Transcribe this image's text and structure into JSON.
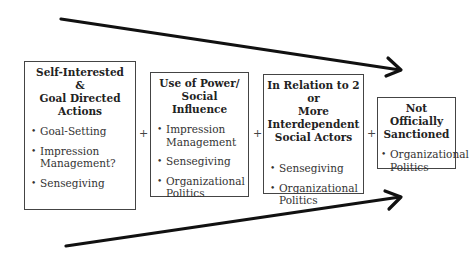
{
  "diagram": {
    "boxes": [
      {
        "title": "Self-Interested & Goal Directed Actions",
        "title_lines": [
          "Self-Interested &",
          "Goal Directed Actions"
        ],
        "items": [
          "Goal-Setting",
          "Impression Management?",
          "Sensegiving"
        ]
      },
      {
        "title": "Use of Power/ Social Influence",
        "title_lines": [
          "Use of Power/",
          "Social Influence"
        ],
        "items": [
          "Impression Management",
          "Sensegiving",
          "Organizational Politics"
        ]
      },
      {
        "title": "In Relation to 2 or More Interdependent Social Actors",
        "title_lines": [
          "In Relation to 2 or",
          "More Interdependent",
          "Social Actors"
        ],
        "items": [
          "Sensegiving",
          "Organizational Politics"
        ]
      },
      {
        "title": "Not Officially Sanctioned",
        "title_lines": [
          "Not Officially",
          "Sanctioned"
        ],
        "items": [
          "Organizational Politics"
        ]
      }
    ],
    "operators": [
      "+",
      "+",
      "+"
    ],
    "arrows": [
      {
        "name": "top-converging-arrow",
        "from": [
          61,
          19
        ],
        "to": [
          402,
          70
        ]
      },
      {
        "name": "bottom-converging-arrow",
        "from": [
          66,
          246
        ],
        "to": [
          402,
          197
        ]
      }
    ]
  }
}
